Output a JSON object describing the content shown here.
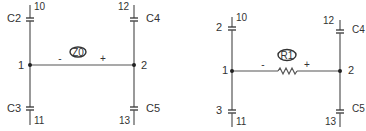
{
  "diagrams": [
    {
      "id": "left",
      "element": {
        "type": "source",
        "label": "Z0",
        "minus": "-",
        "plus": "+"
      },
      "nodes": {
        "left": "1",
        "right": "2"
      },
      "capacitors": {
        "top_left": {
          "name": "C2",
          "terminal": "10"
        },
        "top_right": {
          "name": "C4",
          "terminal": "12"
        },
        "bottom_left": {
          "name": "C3",
          "terminal": "11"
        },
        "bottom_right": {
          "name": "C5",
          "terminal": "13"
        }
      }
    },
    {
      "id": "right",
      "element": {
        "type": "resistor",
        "label": "R1",
        "minus": "-",
        "plus": "+"
      },
      "nodes": {
        "left": "1",
        "right": "2"
      },
      "capacitors": {
        "top_left": {
          "name": "2",
          "terminal": "10"
        },
        "top_right": {
          "name": "C4",
          "terminal": "12"
        },
        "bottom_left": {
          "name": "3",
          "terminal": "11"
        },
        "bottom_right": {
          "name": "C5",
          "terminal": "13"
        }
      }
    }
  ],
  "colors": {
    "wire": "#555555",
    "text": "#333333",
    "background": "#ffffff"
  }
}
